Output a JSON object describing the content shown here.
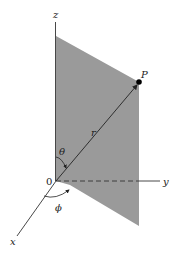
{
  "diagram": {
    "labels": {
      "z_axis": "z",
      "y_axis": "y",
      "x_axis": "x",
      "origin": "0",
      "point": "P",
      "radius": "r",
      "theta": "θ",
      "phi": "ϕ"
    },
    "colors": {
      "plane_fill": "#9a9a9a",
      "axis_stroke": "#333333",
      "background": "#ffffff"
    }
  }
}
